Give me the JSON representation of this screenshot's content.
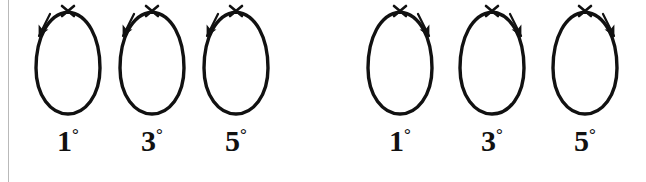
{
  "figure": {
    "background_color": "#ffffff",
    "stroke_color": "#111111",
    "rule_color": "#b9b9b9"
  },
  "panels": [
    {
      "name": "left-panel",
      "arrow_direction": "down-left",
      "loops": [
        {
          "label_value": "1",
          "label_degree": "°",
          "label": "1°",
          "center_x": 68,
          "arrow_side": "left"
        },
        {
          "label_value": "3",
          "label_degree": "°",
          "label": "3°",
          "center_x": 152,
          "arrow_side": "left"
        },
        {
          "label_value": "5",
          "label_degree": "°",
          "label": "5°",
          "center_x": 236,
          "arrow_side": "left"
        }
      ]
    },
    {
      "name": "right-panel",
      "arrow_direction": "down-right",
      "loops": [
        {
          "label_value": "1",
          "label_degree": "°",
          "label": "1°",
          "center_x": 400,
          "arrow_side": "right"
        },
        {
          "label_value": "3",
          "label_degree": "°",
          "label": "3°",
          "center_x": 492,
          "arrow_side": "right"
        },
        {
          "label_value": "5",
          "label_degree": "°",
          "label": "5°",
          "center_x": 585,
          "arrow_side": "right"
        }
      ]
    }
  ],
  "markers": {
    "crossing_marker": "x-crossing-mark",
    "arrow_glyph": "arrow"
  }
}
